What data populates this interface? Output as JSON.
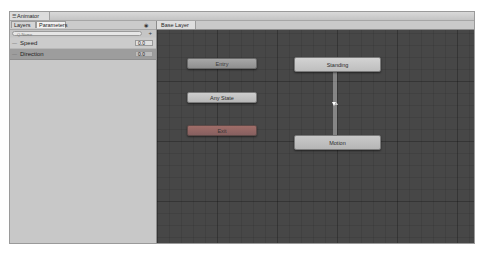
{
  "window": {
    "title": "Animator",
    "title_icon": "animator-icon"
  },
  "left_panel": {
    "tabs": [
      {
        "label": "Layers",
        "active": false
      },
      {
        "label": "Parameters",
        "active": true
      }
    ],
    "visibility_icon": "eye-icon",
    "search": {
      "placeholder": "Q-Name",
      "value": ""
    },
    "add_icon": "plus-dropdown-icon",
    "parameters": [
      {
        "name": "Speed",
        "value": "0.0",
        "selected": false
      },
      {
        "name": "Direction",
        "value": "0.0",
        "selected": true
      }
    ]
  },
  "graph": {
    "breadcrumb": "Base Layer",
    "nodes": [
      {
        "id": "entry",
        "label": "Entry",
        "color": "#9b9b9b"
      },
      {
        "id": "any-state",
        "label": "Any State",
        "color": "#c3c3c3"
      },
      {
        "id": "exit",
        "label": "Exit",
        "color": "#946664"
      },
      {
        "id": "standing",
        "label": "Standing",
        "color": "#c8c8c8"
      },
      {
        "id": "motion",
        "label": "Motion",
        "color": "#bfbfbf"
      }
    ],
    "transitions": [
      {
        "from": "Standing",
        "to": "Motion"
      },
      {
        "from": "Motion",
        "to": "Standing"
      }
    ],
    "background_color": "#474747"
  }
}
